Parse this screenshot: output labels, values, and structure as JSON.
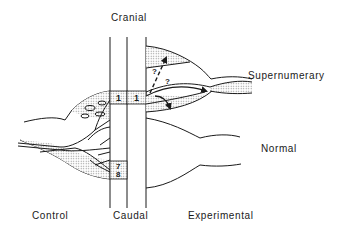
{
  "figure": {
    "labels": {
      "top": "Cranial",
      "supernumerary": "Supernumerary",
      "normal": "Normal",
      "control": "Control",
      "caudal": "Caudal",
      "experimental": "Experimental"
    },
    "segment_numbers": {
      "cranial_left": "1",
      "cranial_right": "1",
      "caudal_top": "7",
      "caudal_bottom": "8"
    },
    "question_marks": [
      "?",
      "?"
    ],
    "colors": {
      "line": "#1a1a1a",
      "stipple": "#9a9a9a",
      "background": "#ffffff"
    }
  }
}
